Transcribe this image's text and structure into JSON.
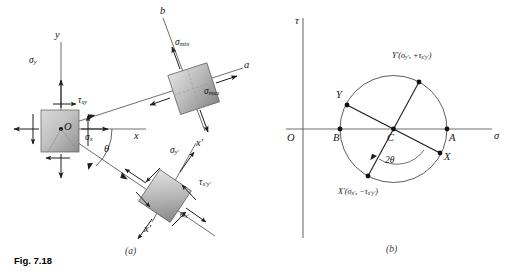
{
  "figure": {
    "caption": "Fig. 7.18",
    "panel_a_label": "(a)",
    "panel_b_label": "(b)"
  },
  "panel_a": {
    "name": "stress-element-transformation-diagram",
    "axes": {
      "y_axis": "y",
      "x_axis": "x",
      "a_axis": "a",
      "b_axis": "b",
      "x_prime_axis": "x′",
      "y_prime_axis": "y′"
    },
    "origin_label": "O",
    "angle_label": "θ",
    "original_element": {
      "sigma_x": "σ",
      "sigma_x_sub": "x",
      "sigma_y": "σ",
      "sigma_y_sub": "y",
      "tau_xy": "τ",
      "tau_xy_sub": "xy"
    },
    "principal_element": {
      "sigma_max": "σ",
      "sigma_max_sub": "max",
      "sigma_min": "σ",
      "sigma_min_sub": "min"
    },
    "rotated_element": {
      "sigma_x_prime": "σ",
      "sigma_x_prime_sub": "x′",
      "sigma_y_prime": "σ",
      "sigma_y_prime_sub": "y′",
      "tau_xy_prime": "τ",
      "tau_xy_prime_sub": "x′y′"
    }
  },
  "panel_b": {
    "name": "mohrs-circle-diagram",
    "axes": {
      "horizontal": "σ",
      "vertical": "τ",
      "origin": "O"
    },
    "points": {
      "A": "A",
      "B": "B",
      "C": "C",
      "X": "X",
      "Y": "Y",
      "X_prime": "X′",
      "Y_prime": "Y′"
    },
    "point_labels": {
      "Y_prime_full_open": "Y′(σ",
      "Y_prime_sub1": "y′",
      "Y_prime_mid": ", +τ",
      "Y_prime_sub2": "x′y′",
      "Y_prime_close": ")",
      "X_prime_full_open": "X′(σ",
      "X_prime_sub1": "x′",
      "X_prime_mid": ", −τ",
      "X_prime_sub2": "x′y′",
      "X_prime_close": ")"
    },
    "angle_label": "2θ"
  },
  "colors": {
    "line": "#2b2b2b",
    "axis": "#6e6e6e",
    "element_fill_light": "#d8d8d8",
    "element_fill_dark": "#9a9a9a",
    "text": "#141414"
  }
}
